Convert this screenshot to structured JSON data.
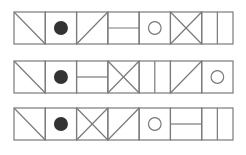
{
  "diagram": {
    "type": "symbol-sequence-puzzle",
    "colors": {
      "stroke": "#7a7a7a",
      "fill_dark": "#333333",
      "background": "#ffffff"
    },
    "geometry": {
      "left": 14,
      "right": 233,
      "cell_count": 7,
      "row_tops": [
        12,
        61,
        108
      ],
      "row_height": 32
    },
    "symbol_legend": {
      "backslash": "diagonal from top-left to bottom-right",
      "filled-circle": "solid dark circle",
      "slash": "diagonal from bottom-left to top-right",
      "horizontal": "horizontal line through middle",
      "open-circle": "hollow circle",
      "x-cross": "both diagonals",
      "vertical": "vertical line through middle"
    },
    "rows": [
      {
        "name": "row-1",
        "cells": [
          "backslash",
          "filled-circle",
          "slash",
          "horizontal",
          "open-circle",
          "x-cross",
          "vertical"
        ]
      },
      {
        "name": "row-2",
        "cells": [
          "backslash",
          "filled-circle",
          "horizontal",
          "x-cross",
          "vertical",
          "slash",
          "open-circle"
        ]
      },
      {
        "name": "row-3",
        "cells": [
          "backslash",
          "filled-circle",
          "x-cross",
          "slash",
          "open-circle",
          "horizontal",
          "vertical"
        ]
      }
    ]
  }
}
